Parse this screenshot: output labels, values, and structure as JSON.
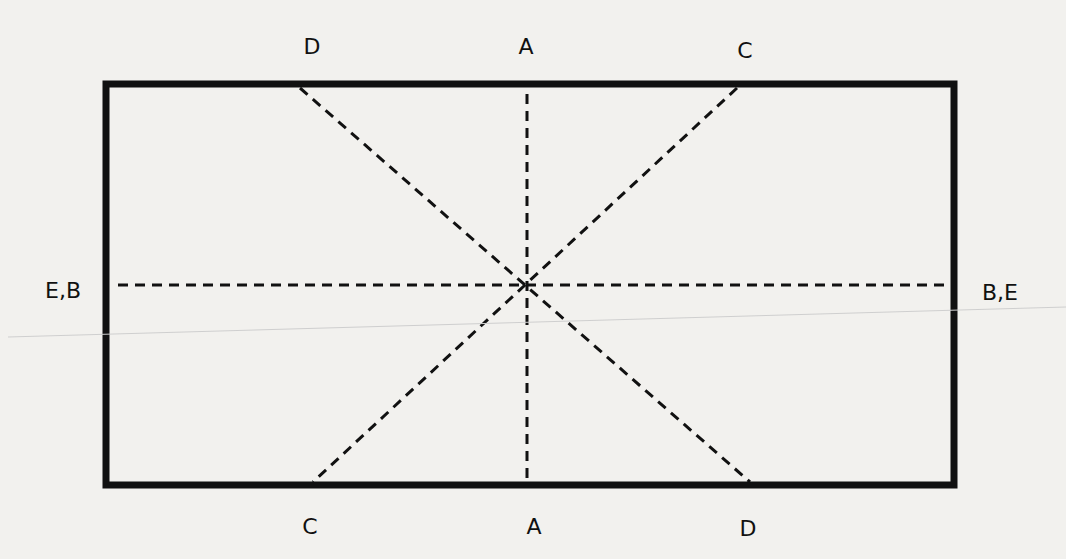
{
  "diagram": {
    "labels": {
      "top_left": "D",
      "top_center": "A",
      "top_right": "C",
      "left": "E,B",
      "right": "B,E",
      "bottom_left": "C",
      "bottom_center": "A",
      "bottom_right": "D"
    },
    "lines": [
      {
        "name": "A-A",
        "style": "dashed",
        "from": "top_center",
        "to": "bottom_center"
      },
      {
        "name": "B,E-E,B",
        "style": "dashed",
        "from": "left",
        "to": "right"
      },
      {
        "name": "C-C",
        "style": "dashed",
        "from": "top_right",
        "to": "bottom_left"
      },
      {
        "name": "D-D",
        "style": "dashed",
        "from": "top_left",
        "to": "bottom_right"
      }
    ],
    "colors": {
      "stroke": "#111111",
      "background": "#f2f1ee"
    }
  }
}
